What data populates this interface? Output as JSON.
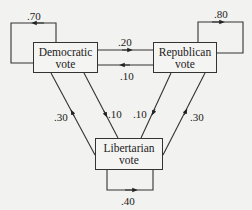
{
  "diagram": {
    "type": "markov-transition-diagram",
    "nodes": [
      {
        "id": "democratic",
        "line1": "Democratic",
        "line2": "vote"
      },
      {
        "id": "republican",
        "line1": "Republican",
        "line2": "vote"
      },
      {
        "id": "libertarian",
        "line1": "Libertarian",
        "line2": "vote"
      }
    ],
    "edges": [
      {
        "from": "democratic",
        "to": "democratic",
        "label": ".70"
      },
      {
        "from": "republican",
        "to": "republican",
        "label": ".80"
      },
      {
        "from": "libertarian",
        "to": "libertarian",
        "label": ".40"
      },
      {
        "from": "democratic",
        "to": "republican",
        "label": ".20"
      },
      {
        "from": "republican",
        "to": "democratic",
        "label": ".10"
      },
      {
        "from": "democratic",
        "to": "libertarian",
        "label": ".10"
      },
      {
        "from": "libertarian",
        "to": "democratic",
        "label": ".30"
      },
      {
        "from": "republican",
        "to": "libertarian",
        "label": ".10"
      },
      {
        "from": "libertarian",
        "to": "republican",
        "label": ".30"
      }
    ],
    "colors": {
      "line": "#333333",
      "background": "#f2f2f0",
      "text": "#222222"
    }
  }
}
